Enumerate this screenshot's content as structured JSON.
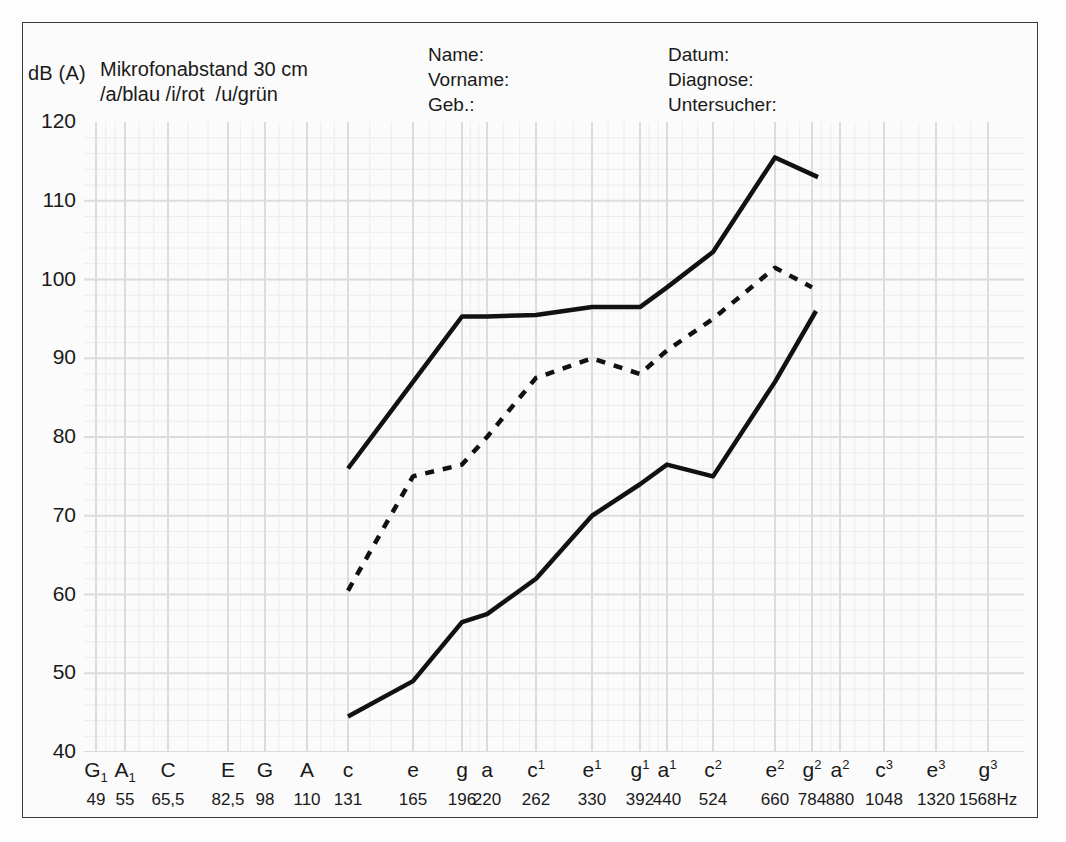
{
  "header": {
    "y_axis_unit": "dB (A)",
    "mic_line1": "Mikrofonabstand 30 cm",
    "mic_line2": "/a/blau /i/rot  /u/grün",
    "form_left": [
      "Name:",
      "Vorname:",
      "Geb.:"
    ],
    "form_right": [
      "Datum:",
      "Diagnose:",
      "Untersucher:"
    ]
  },
  "colors": {
    "ink": "#111111",
    "frame": "#3a3a3a",
    "grid_major": "#dcdcdc",
    "grid_minor": "#ececec",
    "paper": "#fbfbfb"
  },
  "chart_data": {
    "type": "line",
    "xlabel": "",
    "ylabel": "dB (A)",
    "ylim": [
      40,
      120
    ],
    "yticks": [
      120,
      110,
      100,
      90,
      80,
      70,
      60,
      50,
      40
    ],
    "grid": true,
    "legend": "none",
    "x_notes": [
      "G₁",
      "A₁",
      "C",
      "E",
      "G",
      "A",
      "c",
      "e",
      "g",
      "a",
      "c¹",
      "e¹",
      "g¹",
      "a¹",
      "c²",
      "e²",
      "g²",
      "a²",
      "c³",
      "e³",
      "g³"
    ],
    "x_note_html": [
      "G<sub>1</sub>",
      "A<sub>1</sub>",
      "C",
      "E",
      "G",
      "A",
      "c",
      "e",
      "g",
      "a",
      "c<sup>1</sup>",
      "e<sup>1</sup>",
      "g<sup>1</sup>",
      "a<sup>1</sup>",
      "c<sup>2</sup>",
      "e<sup>2</sup>",
      "g<sup>2</sup>",
      "a<sup>2</sup>",
      "c<sup>3</sup>",
      "e<sup>3</sup>",
      "g<sup>3</sup>"
    ],
    "x_freqs": [
      "49",
      "55",
      "65,5",
      "82,5",
      "98",
      "110",
      "131",
      "165",
      "196",
      "220",
      "262",
      "330",
      "392",
      "440",
      "524",
      "660",
      "784",
      "880",
      "1048",
      "1320",
      "1568Hz"
    ],
    "x_px": [
      96,
      125,
      168,
      228,
      265,
      307,
      348,
      413,
      462,
      487,
      536,
      592,
      640,
      667,
      713,
      775,
      812,
      840,
      884,
      936,
      988
    ],
    "series": [
      {
        "name": "upper-contour",
        "style": "solid",
        "x_notes": [
          "c",
          "e",
          "g",
          "a",
          "c¹",
          "e¹",
          "g¹",
          "a¹",
          "c²",
          "e²",
          "g²"
        ],
        "x_px": [
          348,
          413,
          462,
          487,
          536,
          592,
          640,
          667,
          713,
          775,
          818
        ],
        "values": [
          76.0,
          87.0,
          95.3,
          95.3,
          95.5,
          96.5,
          96.5,
          99.0,
          103.5,
          115.5,
          113.0
        ]
      },
      {
        "name": "middle-contour",
        "style": "dotted",
        "x_notes": [
          "c",
          "e",
          "g",
          "a",
          "c¹",
          "e¹",
          "g¹",
          "a¹",
          "c²",
          "e²",
          "g²"
        ],
        "x_px": [
          348,
          413,
          462,
          487,
          536,
          592,
          640,
          667,
          713,
          775,
          812
        ],
        "values": [
          60.5,
          75.0,
          76.5,
          80.0,
          87.5,
          90.0,
          88.0,
          91.0,
          95.0,
          101.5,
          99.0
        ]
      },
      {
        "name": "lower-contour",
        "style": "solid",
        "x_notes": [
          "c",
          "e",
          "g",
          "a",
          "c¹",
          "e¹",
          "g¹",
          "a¹",
          "c²",
          "e²",
          "g²"
        ],
        "x_px": [
          348,
          413,
          462,
          487,
          536,
          592,
          640,
          667,
          713,
          775,
          816
        ],
        "values": [
          44.5,
          49.0,
          56.5,
          57.5,
          62.0,
          70.0,
          74.0,
          76.5,
          75.0,
          87.0,
          96.0
        ]
      }
    ]
  }
}
